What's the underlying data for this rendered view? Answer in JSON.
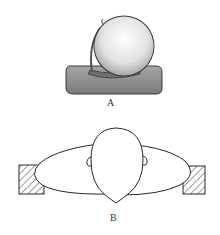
{
  "figures": [
    {
      "id": "A",
      "label": "A",
      "description": "Head resting on a cushion, perspective view"
    },
    {
      "id": "B",
      "label": "B",
      "description": "Top view of head on cushion between supports"
    }
  ],
  "colors": {
    "line": "#2a2a2a",
    "pillow_fill": "#8c8c8c",
    "head_fill": "#e6e6e6",
    "hatch": "#333333",
    "background": "#ffffff"
  }
}
